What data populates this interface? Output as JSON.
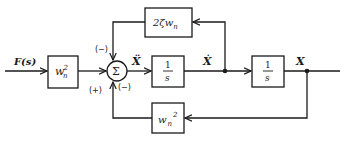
{
  "diagram": {
    "type": "block-diagram",
    "input": {
      "label": "F(s)"
    },
    "blocks": {
      "gain_in": {
        "label_base": "w",
        "label_sub": "n",
        "label_sup": "2"
      },
      "feedback_top": {
        "label_prefix": "2ζ",
        "label_base": "w",
        "label_sub": "n"
      },
      "integrator1": {
        "num": "1",
        "den": "s"
      },
      "integrator2": {
        "num": "1",
        "den": "s"
      },
      "feedback_bottom": {
        "label_base": "w",
        "label_sub": "n",
        "label_sup": "2"
      }
    },
    "summing_junction": {
      "symbol": "Σ",
      "signs": {
        "top": "(−)",
        "left": "(+)",
        "bottom": "(−)"
      }
    },
    "signals": {
      "accel": "Ẍ",
      "velocity": "Ẋ",
      "position": "X"
    },
    "colors": {
      "line": "#1a1a1a",
      "background": "#ffffff"
    }
  }
}
